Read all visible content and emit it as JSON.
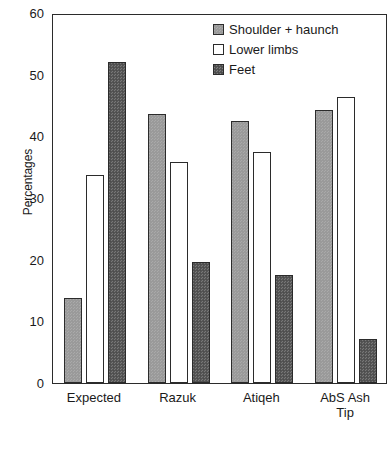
{
  "chart_data": {
    "type": "bar",
    "title": "",
    "xlabel": "",
    "ylabel": "Percentages",
    "ylim": [
      0,
      60
    ],
    "yticks": [
      0,
      10,
      20,
      30,
      40,
      50,
      60
    ],
    "ytick_labels": [
      "0",
      "10",
      "20",
      "30",
      "40",
      "50",
      "60"
    ],
    "grid": false,
    "legend_position": "top-right",
    "categories": [
      "Expected",
      "Razuk",
      "Atiqeh",
      "AbS Ash Tip"
    ],
    "category_lines": [
      [
        "Expected"
      ],
      [
        "Razuk"
      ],
      [
        "Atiqeh"
      ],
      [
        "AbS Ash",
        "Tip"
      ]
    ],
    "series": [
      {
        "name": "Shoulder + haunch",
        "color": "#9a9a9a",
        "values": [
          13.8,
          43.7,
          42.5,
          44.3
        ]
      },
      {
        "name": "Lower limbs",
        "color": "#ffffff",
        "values": [
          33.8,
          35.8,
          37.5,
          46.3
        ]
      },
      {
        "name": "Feet",
        "color": "#585858",
        "values": [
          52.0,
          19.7,
          17.5,
          7.1
        ]
      }
    ]
  }
}
